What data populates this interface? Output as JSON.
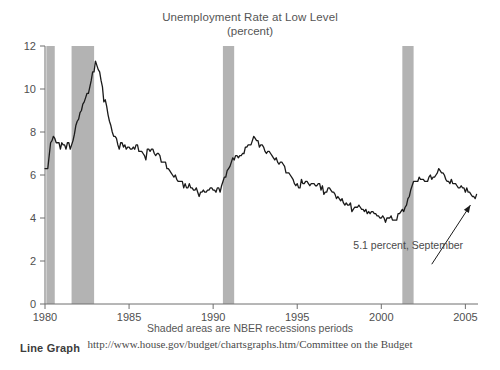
{
  "header": {
    "title": "Unemployment Rate at Low Level",
    "subtitle": "(percent)"
  },
  "footer": {
    "note": "Shaded areas are NBER recessions periods",
    "url": "http://www.house.gov/budget/chartsgraphs.htm/Committee on the Budget",
    "corner_label": "Line Graph"
  },
  "colors": {
    "line": "#1a1a1a",
    "recession_band": "#b3b3b3",
    "axis": "#6e6e6e",
    "text": "#4a4a4a",
    "background": "#ffffff"
  },
  "chart_data": {
    "type": "line",
    "title": "Unemployment Rate at Low Level",
    "subtitle": "(percent)",
    "xlabel": "",
    "ylabel": "",
    "ylim": [
      0,
      12
    ],
    "xlim": [
      1980.0,
      2005.75
    ],
    "yticks": [
      0,
      2,
      4,
      6,
      8,
      10,
      12
    ],
    "ytick_labels": [
      "0",
      "2",
      "4",
      "6",
      "8",
      "10",
      "12"
    ],
    "xticks": [
      1980,
      1985,
      1990,
      1995,
      2000,
      2005
    ],
    "xtick_labels": [
      "1980",
      "1985",
      "1990",
      "1995",
      "2000",
      "2005"
    ],
    "grid": false,
    "legend": null,
    "annotations": [
      {
        "text": "5.1 percent, September",
        "x": 2001.6,
        "y": 2.55,
        "arrow_from": [
          2003.0,
          1.85
        ],
        "arrow_to": [
          2005.3,
          4.6
        ]
      }
    ],
    "shaded_regions": [
      {
        "label": "recession",
        "start": 1980.08,
        "end": 1980.58
      },
      {
        "label": "recession",
        "start": 1981.58,
        "end": 1982.92
      },
      {
        "label": "recession",
        "start": 1990.58,
        "end": 1991.25
      },
      {
        "label": "recession",
        "start": 2001.25,
        "end": 2001.92
      }
    ],
    "series": [
      {
        "name": "Unemployment Rate",
        "x_start": 1980.0,
        "x_step": 0.08333,
        "values": [
          6.3,
          6.3,
          6.3,
          6.9,
          7.5,
          7.6,
          7.8,
          7.7,
          7.5,
          7.5,
          7.5,
          7.2,
          7.5,
          7.4,
          7.4,
          7.2,
          7.5,
          7.5,
          7.2,
          7.4,
          7.6,
          7.9,
          8.3,
          8.5,
          8.6,
          8.9,
          9.0,
          9.3,
          9.4,
          9.6,
          9.8,
          9.8,
          10.1,
          10.4,
          10.8,
          10.8,
          11.3,
          11.1,
          10.9,
          10.8,
          10.4,
          10.1,
          9.4,
          9.5,
          9.2,
          8.8,
          8.5,
          8.3,
          8.0,
          7.8,
          7.8,
          7.7,
          7.4,
          7.2,
          7.5,
          7.5,
          7.3,
          7.4,
          7.2,
          7.3,
          7.3,
          7.2,
          7.2,
          7.3,
          7.2,
          7.4,
          7.4,
          7.1,
          7.1,
          7.1,
          7.0,
          6.9,
          6.7,
          7.2,
          7.2,
          7.1,
          7.2,
          7.2,
          7.0,
          6.9,
          7.0,
          7.0,
          6.9,
          6.6,
          6.6,
          6.6,
          6.6,
          6.3,
          6.3,
          6.2,
          6.1,
          6.0,
          5.9,
          6.0,
          5.8,
          5.7,
          5.7,
          5.7,
          5.7,
          5.4,
          5.6,
          5.4,
          5.4,
          5.6,
          5.4,
          5.4,
          5.3,
          5.3,
          5.4,
          5.2,
          5.0,
          5.2,
          5.2,
          5.3,
          5.2,
          5.2,
          5.3,
          5.3,
          5.4,
          5.4,
          5.3,
          5.3,
          5.2,
          5.4,
          5.4,
          5.2,
          5.5,
          5.7,
          5.9,
          5.9,
          6.2,
          6.3,
          6.4,
          6.6,
          6.8,
          6.7,
          6.9,
          6.9,
          6.8,
          6.9,
          6.9,
          7.0,
          7.0,
          7.3,
          7.3,
          7.4,
          7.4,
          7.4,
          7.6,
          7.8,
          7.7,
          7.6,
          7.6,
          7.3,
          7.4,
          7.4,
          7.3,
          7.1,
          7.0,
          7.1,
          7.1,
          7.0,
          6.9,
          6.8,
          6.7,
          6.8,
          6.6,
          6.5,
          6.6,
          6.6,
          6.5,
          6.4,
          6.1,
          6.1,
          6.1,
          6.0,
          5.9,
          5.8,
          5.6,
          5.5,
          5.6,
          5.4,
          5.4,
          5.8,
          5.6,
          5.6,
          5.7,
          5.7,
          5.6,
          5.5,
          5.6,
          5.6,
          5.6,
          5.5,
          5.5,
          5.6,
          5.6,
          5.3,
          5.5,
          5.1,
          5.2,
          5.2,
          5.4,
          5.4,
          5.3,
          5.2,
          5.2,
          5.1,
          4.9,
          5.0,
          4.9,
          4.8,
          4.9,
          4.7,
          4.6,
          4.7,
          4.6,
          4.6,
          4.7,
          4.3,
          4.4,
          4.5,
          4.5,
          4.5,
          4.6,
          4.5,
          4.4,
          4.4,
          4.3,
          4.4,
          4.2,
          4.3,
          4.2,
          4.3,
          4.3,
          4.2,
          4.2,
          4.1,
          4.1,
          4.0,
          4.0,
          4.1,
          4.0,
          3.8,
          4.0,
          4.0,
          4.0,
          4.1,
          3.9,
          3.9,
          3.9,
          3.9,
          4.2,
          4.2,
          4.3,
          4.4,
          4.3,
          4.5,
          4.6,
          4.9,
          5.0,
          5.3,
          5.5,
          5.7,
          5.7,
          5.7,
          5.7,
          5.9,
          5.8,
          5.8,
          5.8,
          5.7,
          5.7,
          5.7,
          5.9,
          6.0,
          5.8,
          5.9,
          5.9,
          6.0,
          6.1,
          6.3,
          6.2,
          6.1,
          6.1,
          6.0,
          5.8,
          5.7,
          5.7,
          5.6,
          5.8,
          5.6,
          5.6,
          5.6,
          5.5,
          5.4,
          5.4,
          5.5,
          5.4,
          5.4,
          5.2,
          5.4,
          5.2,
          5.2,
          5.1,
          5.0,
          5.0,
          4.9,
          5.1
        ]
      }
    ]
  }
}
